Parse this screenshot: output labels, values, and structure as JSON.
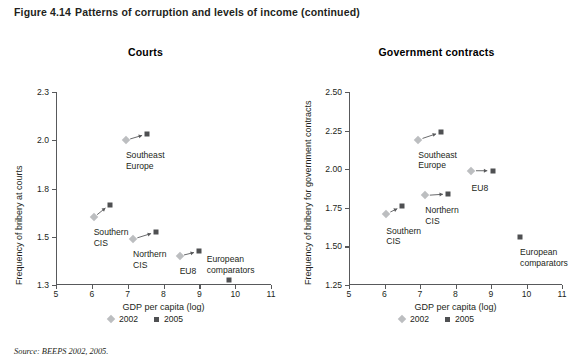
{
  "figure": {
    "number": "Figure 4.14",
    "caption": "Patterns of corruption and levels of income (continued)"
  },
  "source": "Source: BEEPS 2002, 2005.",
  "legend": {
    "items": [
      {
        "label": "2002",
        "marker": "diamond",
        "color": "#bcbec0"
      },
      {
        "label": "2005",
        "marker": "square",
        "color": "#4f5052"
      }
    ]
  },
  "chart_data": [
    {
      "type": "scatter",
      "title": "Courts",
      "xlabel": "GDP per capita (log)",
      "ylabel": "Frequency of bribery at courts",
      "xlim": [
        5,
        11
      ],
      "ylim": [
        1.3,
        2.3
      ],
      "xticks": [
        "5",
        "6",
        "7",
        "8",
        "9",
        "10",
        "11"
      ],
      "yticks": [
        "1.3",
        "1.5",
        "1.8",
        "2.0",
        "2.3"
      ],
      "grid": false,
      "legend_position": "bottom-center",
      "series": [
        {
          "name": "2002",
          "marker": "diamond",
          "color": "#bcbec0"
        },
        {
          "name": "2005",
          "marker": "square",
          "color": "#4f5052"
        }
      ],
      "points": [
        {
          "group": "Southeast Europe",
          "label": "Southeast\nEurope",
          "y2002": 2.0,
          "x2002": 6.95,
          "y2005": 2.04,
          "x2005": 7.55,
          "label_dx": 0,
          "label_dy": 10
        },
        {
          "group": "Southern CIS",
          "label": "Southern\nCIS",
          "y2002": 1.62,
          "x2002": 6.05,
          "y2005": 1.7,
          "x2005": 6.5,
          "label_dx": 0,
          "label_dy": 10
        },
        {
          "group": "Northern CIS",
          "label": "Northern\nCIS",
          "y2002": 1.49,
          "x2002": 7.15,
          "y2005": 1.53,
          "x2005": 7.8,
          "label_dx": 0,
          "label_dy": 10
        },
        {
          "group": "EU8",
          "label": "EU8",
          "y2002": 1.42,
          "x2002": 8.45,
          "y2005": 1.44,
          "x2005": 9.0,
          "label_dx": 0,
          "label_dy": 10
        },
        {
          "group": "European comparators",
          "label": "European\ncomparators",
          "y2002": null,
          "x2002": null,
          "y2005": 1.32,
          "x2005": 9.82,
          "label_dx": 0,
          "label_dy": -26
        }
      ]
    },
    {
      "type": "scatter",
      "title": "Government contracts",
      "xlabel": "GDP per capita (log)",
      "ylabel": "Frequency of bribery for government contracts",
      "xlim": [
        5,
        11
      ],
      "ylim": [
        1.25,
        2.5
      ],
      "xticks": [
        "5",
        "6",
        "7",
        "8",
        "9",
        "10",
        "11"
      ],
      "yticks": [
        "1.25",
        "1.50",
        "1.75",
        "2.00",
        "2.25",
        "2.50"
      ],
      "grid": false,
      "legend_position": "bottom-center",
      "series": [
        {
          "name": "2002",
          "marker": "diamond",
          "color": "#bcbec0"
        },
        {
          "name": "2005",
          "marker": "square",
          "color": "#4f5052"
        }
      ],
      "points": [
        {
          "group": "Southeast Europe",
          "label": "Southeast\nEurope",
          "y2002": 2.19,
          "x2002": 6.95,
          "y2005": 2.24,
          "x2005": 7.6,
          "label_dx": 0,
          "label_dy": 10
        },
        {
          "group": "EU8",
          "label": "EU8",
          "y2002": 1.99,
          "x2002": 8.45,
          "y2005": 1.99,
          "x2005": 9.05,
          "label_dx": 0,
          "label_dy": 12
        },
        {
          "group": "Northern CIS",
          "label": "Northern\nCIS",
          "y2002": 1.83,
          "x2002": 7.15,
          "y2005": 1.84,
          "x2005": 7.8,
          "label_dx": 0,
          "label_dy": 10
        },
        {
          "group": "Southern CIS",
          "label": "Southern\nCIS",
          "y2002": 1.71,
          "x2002": 6.05,
          "y2005": 1.76,
          "x2005": 6.5,
          "label_dx": 0,
          "label_dy": 12
        },
        {
          "group": "European comparators",
          "label": "European\ncomparators",
          "y2002": null,
          "x2002": null,
          "y2005": 1.56,
          "x2005": 9.82,
          "label_dx": 0,
          "label_dy": 10
        }
      ]
    }
  ]
}
